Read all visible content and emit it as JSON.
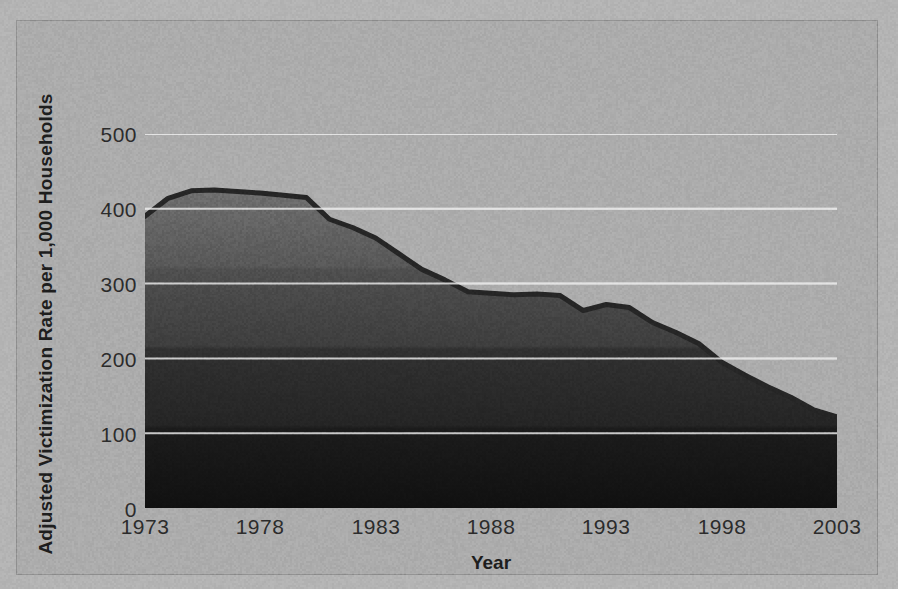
{
  "figure": {
    "background_color": "#ababab",
    "frame_color": "#8e8e8e",
    "page_color": "#b3b3b3"
  },
  "axes": {
    "y_label": "Adjusted Victimization Rate per 1,000 Households",
    "x_label": "Year",
    "y_ticks": [
      "0",
      "100",
      "200",
      "300",
      "400",
      "500"
    ],
    "x_ticks": [
      "1973",
      "1978",
      "1983",
      "1988",
      "1993",
      "1998",
      "2003"
    ]
  },
  "chart_data": {
    "type": "area",
    "title": "",
    "subtitle": "",
    "xlabel": "Year",
    "ylabel": "Adjusted Victimization Rate per 1,000 Households",
    "xlim": [
      1973,
      2003
    ],
    "ylim": [
      0,
      500
    ],
    "xtick_values": [
      1973,
      1978,
      1983,
      1988,
      1993,
      1998,
      2003
    ],
    "ytick_values": [
      0,
      100,
      200,
      300,
      400,
      500
    ],
    "grid": "horizontal",
    "legend": "none",
    "legend_position": "none",
    "fill_top_color": "#6b6b6b",
    "fill_bottom_color": "#131313",
    "line_color": "#2a2a2a",
    "gridline_color": "#d8d8d8",
    "x": [
      1973,
      1974,
      1975,
      1976,
      1977,
      1978,
      1979,
      1980,
      1981,
      1982,
      1983,
      1984,
      1985,
      1986,
      1987,
      1988,
      1989,
      1990,
      1991,
      1992,
      1993,
      1994,
      1995,
      1996,
      1997,
      1998,
      1999,
      2000,
      2001,
      2002,
      2003
    ],
    "series": [
      {
        "name": "Adjusted victimization rate per 1,000 households",
        "values": [
          390,
          414,
          424,
          425,
          423,
          421,
          418,
          415,
          386,
          375,
          361,
          340,
          319,
          305,
          289,
          287,
          285,
          286,
          284,
          264,
          272,
          268,
          248,
          235,
          220,
          195,
          178,
          162,
          148,
          131,
          122
        ]
      }
    ]
  }
}
